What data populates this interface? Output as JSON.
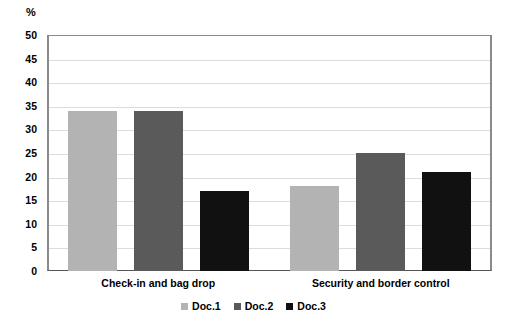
{
  "chart_data": {
    "type": "bar",
    "title": "",
    "subtitle": "",
    "xlabel": "",
    "ylabel": "%",
    "ylim": [
      0,
      50
    ],
    "y_ticks": [
      0,
      5,
      10,
      15,
      20,
      25,
      30,
      35,
      40,
      45,
      50
    ],
    "y_tick_labels": [
      "0",
      "5",
      "10",
      "15",
      "20",
      "25",
      "30",
      "35",
      "40",
      "45",
      "50"
    ],
    "grid": true,
    "legend_position": "bottom-center",
    "categories": [
      "Check-in and bag drop",
      "Security and border control"
    ],
    "series": [
      {
        "name": "Doc.1",
        "color": "#b3b3b3",
        "values": [
          34,
          18
        ]
      },
      {
        "name": "Doc.2",
        "color": "#5a5a5a",
        "values": [
          34,
          25
        ]
      },
      {
        "name": "Doc.3",
        "color": "#111111",
        "values": [
          17,
          21
        ]
      }
    ],
    "annotations": []
  },
  "axis": {
    "unit_label": "%"
  },
  "legend": {
    "items": [
      {
        "label": "Doc.1",
        "color": "#b3b3b3"
      },
      {
        "label": "Doc.2",
        "color": "#5a5a5a"
      },
      {
        "label": "Doc.3",
        "color": "#111111"
      }
    ]
  },
  "colors": {
    "background": "#ffffff",
    "axis_line": "#8a8a8a",
    "gridline": "#dcdcdc",
    "text": "#000000",
    "series_1": "#b3b3b3",
    "series_2": "#5a5a5a",
    "series_3": "#111111"
  }
}
